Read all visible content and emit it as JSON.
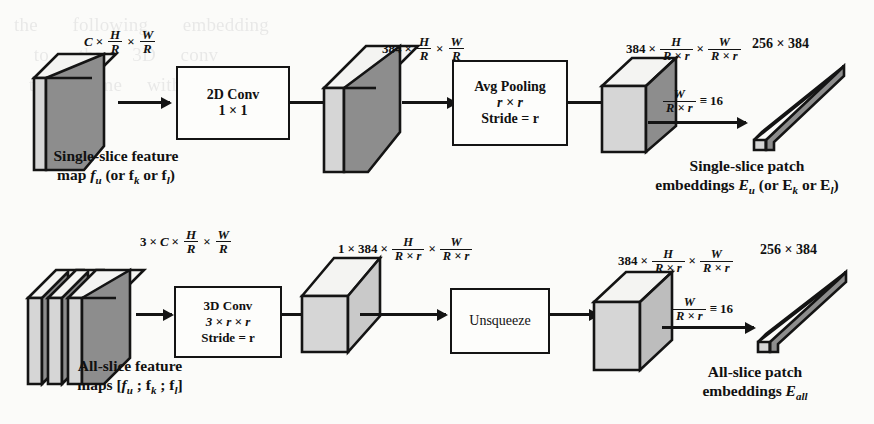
{
  "figure": {
    "type": "architecture-diagram",
    "colors": {
      "outline": "#141414",
      "dark_face": "#8d8d8d",
      "light_face": "#d6d6d6",
      "white_face": "#f4f4f2",
      "background": "#fbfbf9"
    }
  },
  "rows": [
    {
      "id": "single-slice-row",
      "caption_input": {
        "line1": "Single-slice feature",
        "line2_prefix": "map ",
        "line2_sym": "f",
        "line2_sub": "u",
        "line2_rest": " (or f",
        "line2_sub2": "k",
        "line2_rest2": " or f",
        "line2_sub3": "l",
        "line2_rest3": ")"
      },
      "caption_output": {
        "line1": "Single-slice patch",
        "line2_prefix": "embeddings ",
        "line2_sym": "E",
        "line2_sub": "u",
        "line2_rest": " (or E",
        "line2_sub2": "k",
        "line2_rest2": " or E",
        "line2_sub3": "l",
        "line2_rest3": ")"
      },
      "op": {
        "line1": "2D Conv",
        "line2": "1 × 1"
      },
      "op2": {
        "line1": "Avg Pooling",
        "line2_it": "r × r",
        "line3": "Stride = r"
      },
      "shape_in": {
        "c": "C",
        "sep": "×",
        "h_num": "H",
        "h_den": "R",
        "w_num": "W",
        "w_den": "R"
      },
      "shape_mid": {
        "c": "384",
        "sep": "×",
        "h_num": "H",
        "h_den": "R",
        "w_num": "W",
        "w_den": "R"
      },
      "shape_out": {
        "c": "384",
        "sep": "×",
        "h_num": "H",
        "h_den": "R × r",
        "w_num": "W",
        "w_den": "R × r"
      },
      "ratio": {
        "num": "W",
        "den": "R × r",
        "eq": "≡",
        "value": "16"
      },
      "embed_dims": "256 × 384"
    },
    {
      "id": "all-slice-row",
      "caption_input": {
        "line1": "All-slice feature",
        "line2_prefix": "maps [",
        "line2_sym": "f",
        "line2_sub": "u",
        "line2_rest": " ; f",
        "line2_sub2": "k",
        "line2_rest2": " ; f",
        "line2_sub3": "l",
        "line2_rest3": "]"
      },
      "caption_output": {
        "line1": "All-slice patch",
        "line2_prefix": "embeddings ",
        "line2_sym": "E",
        "line2_sub": "all",
        "line2_rest": ""
      },
      "op": {
        "line1": "3D Conv",
        "line2_it": "3 × r × r",
        "line3": "Stride = r"
      },
      "op2": {
        "line1": "Unsqueeze"
      },
      "shape_in": {
        "n": "3",
        "c": "C",
        "sep": "×",
        "h_num": "H",
        "h_den": "R",
        "w_num": "W",
        "w_den": "R"
      },
      "shape_mid": {
        "n": "1",
        "c": "384",
        "sep": "×",
        "h_num": "H",
        "h_den": "R × r",
        "w_num": "W",
        "w_den": "R × r"
      },
      "shape_out": {
        "c": "384",
        "sep": "×",
        "h_num": "H",
        "h_den": "R × r",
        "w_num": "W",
        "w_den": "R × r"
      },
      "ratio": {
        "num": "W",
        "den": "R × r",
        "eq": "≡",
        "value": "16"
      },
      "embed_dims": "256 × 384"
    }
  ],
  "bleed_text": "the       following       embedding\n    to      the      3D     conv\n   the      same     with      s"
}
